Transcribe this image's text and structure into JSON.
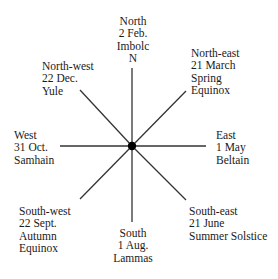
{
  "diagram": {
    "center": {
      "x": 132,
      "y": 146
    },
    "line_color": "#333333",
    "hub_color": "#000000",
    "spokes": [
      {
        "name": "north",
        "x": 132,
        "y": 68
      },
      {
        "name": "north-east",
        "x": 186,
        "y": 91
      },
      {
        "name": "east",
        "x": 206,
        "y": 146
      },
      {
        "name": "south-east",
        "x": 186,
        "y": 200
      },
      {
        "name": "south",
        "x": 132,
        "y": 222
      },
      {
        "name": "south-west",
        "x": 80,
        "y": 199
      },
      {
        "name": "west",
        "x": 60,
        "y": 146
      },
      {
        "name": "north-west",
        "x": 80,
        "y": 90
      }
    ]
  },
  "labels": {
    "north": {
      "direction": "North",
      "date": "2 Feb.",
      "festival": "Imbolc",
      "marker": "N"
    },
    "north_east": {
      "direction": "North-east",
      "date": "21 March",
      "festival_line1": "Spring",
      "festival_line2": "Equinox"
    },
    "east": {
      "direction": "East",
      "date": "1 May",
      "festival": "Beltain"
    },
    "south_east": {
      "direction": "South-east",
      "date": "21 June",
      "festival": "Summer Solstice"
    },
    "south": {
      "direction": "South",
      "date": "1 Aug.",
      "festival": "Lammas"
    },
    "south_west": {
      "direction": "South-west",
      "date": "22 Sept.",
      "festival_line1": "Autumn",
      "festival_line2": "Equinox"
    },
    "west": {
      "direction": "West",
      "date": "31 Oct.",
      "festival": "Samhain"
    },
    "north_west": {
      "direction": "North-west",
      "date": "22 Dec.",
      "festival": "Yule"
    }
  }
}
